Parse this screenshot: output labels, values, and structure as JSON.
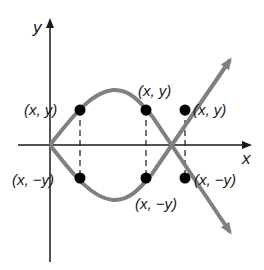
{
  "diagram": {
    "axes": {
      "x_label": "x",
      "y_label": "y"
    },
    "points": [
      {
        "label": "(x, y)",
        "position": "upper-left"
      },
      {
        "label": "(x, y)",
        "position": "upper-middle"
      },
      {
        "label": "(x, y)",
        "position": "upper-right"
      },
      {
        "label": "(x, −y)",
        "position": "lower-left"
      },
      {
        "label": "(x, −y)",
        "position": "lower-middle"
      },
      {
        "label": "(x, −y)",
        "position": "lower-right"
      }
    ],
    "colors": {
      "curve": "#808080",
      "axis": "#1a1a1a",
      "point": "#000000"
    }
  }
}
